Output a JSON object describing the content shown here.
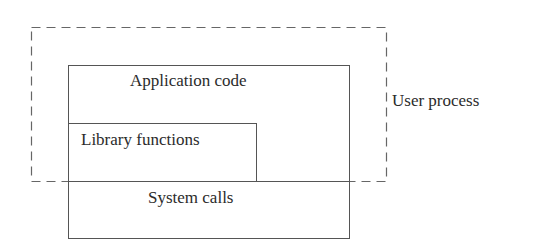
{
  "diagram": {
    "user_process_label": "User process",
    "layers": {
      "application_code": "Application code",
      "library_functions": "Library functions",
      "system_calls": "System calls"
    },
    "colors": {
      "line": "#555555",
      "dashed_line": "#666666",
      "text": "#2b2b2b",
      "background": "#ffffff"
    }
  }
}
